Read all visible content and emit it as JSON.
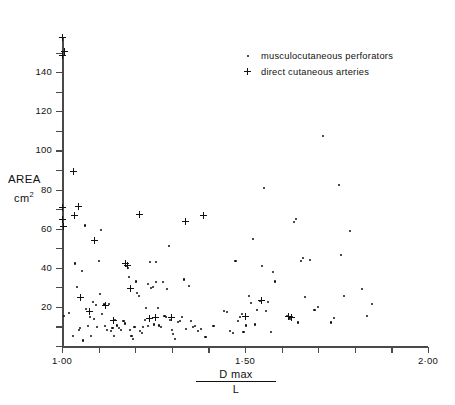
{
  "chart_data": {
    "type": "scatter",
    "title": "",
    "xlabel": "Dmax / L",
    "xlabel_numerator": "D max",
    "xlabel_denominator": "L",
    "ylabel": "AREA",
    "ylabel_unit": "cm2",
    "xlim": [
      1.0,
      2.0
    ],
    "ylim": [
      0,
      160
    ],
    "x_ticks": [
      1.0,
      1.1,
      1.2,
      1.3,
      1.4,
      1.5,
      1.6,
      1.7,
      1.8,
      1.9,
      2.0
    ],
    "x_tick_labels": [
      "1·00",
      "",
      "",
      "",
      "",
      "1·50",
      "",
      "",
      "",
      "",
      "2·00"
    ],
    "y_ticks": [
      0,
      10,
      20,
      30,
      40,
      50,
      60,
      70,
      80,
      90,
      100,
      110,
      120,
      130,
      140,
      150
    ],
    "y_tick_labels": [
      "",
      "",
      "20",
      "",
      "40",
      "",
      "60",
      "",
      "80",
      "",
      "100",
      "",
      "120",
      "",
      "140",
      ""
    ],
    "grid": false,
    "legend_position": "top-right",
    "series": [
      {
        "name": "musculocutaneous perforators",
        "marker": "dot",
        "points": [
          [
            1.006,
            15.3
          ],
          [
            1.018,
            17.0
          ],
          [
            1.03,
            5.0
          ],
          [
            1.036,
            42.2
          ],
          [
            1.04,
            30.3
          ],
          [
            1.046,
            8.0
          ],
          [
            1.05,
            9.0
          ],
          [
            1.054,
            38.5
          ],
          [
            1.058,
            2.8
          ],
          [
            1.062,
            61.6
          ],
          [
            1.066,
            19.0
          ],
          [
            1.072,
            10.0
          ],
          [
            1.076,
            15.0
          ],
          [
            1.08,
            5.0
          ],
          [
            1.084,
            22.5
          ],
          [
            1.088,
            14.0
          ],
          [
            1.092,
            20.8
          ],
          [
            1.096,
            9.5
          ],
          [
            1.1,
            43.3
          ],
          [
            1.104,
            26.5
          ],
          [
            1.106,
            59.5
          ],
          [
            1.11,
            16.5
          ],
          [
            1.114,
            21.2
          ],
          [
            1.118,
            10.3
          ],
          [
            1.122,
            8.0
          ],
          [
            1.128,
            21.3
          ],
          [
            1.134,
            7.8
          ],
          [
            1.138,
            9.0
          ],
          [
            1.142,
            5.3
          ],
          [
            1.146,
            13.2
          ],
          [
            1.15,
            10.5
          ],
          [
            1.156,
            9.0
          ],
          [
            1.162,
            8.2
          ],
          [
            1.168,
            13.0
          ],
          [
            1.172,
            11.5
          ],
          [
            1.176,
            41.0
          ],
          [
            1.18,
            39.8
          ],
          [
            1.184,
            35.5
          ],
          [
            1.186,
            8.0
          ],
          [
            1.19,
            5.0
          ],
          [
            1.194,
            3.5
          ],
          [
            1.198,
            9.5
          ],
          [
            1.202,
            33.0
          ],
          [
            1.206,
            27.0
          ],
          [
            1.21,
            25.5
          ],
          [
            1.214,
            7.5
          ],
          [
            1.218,
            6.5
          ],
          [
            1.222,
            9.5
          ],
          [
            1.226,
            13.5
          ],
          [
            1.23,
            19.5
          ],
          [
            1.234,
            10.0
          ],
          [
            1.236,
            31.5
          ],
          [
            1.24,
            43.0
          ],
          [
            1.244,
            29.5
          ],
          [
            1.248,
            30.0
          ],
          [
            1.252,
            11.0
          ],
          [
            1.256,
            43.0
          ],
          [
            1.258,
            32.8
          ],
          [
            1.262,
            19.5
          ],
          [
            1.266,
            10.5
          ],
          [
            1.27,
            9.5
          ],
          [
            1.276,
            32.5
          ],
          [
            1.28,
            15.5
          ],
          [
            1.284,
            15.0
          ],
          [
            1.288,
            29.0
          ],
          [
            1.292,
            51.0
          ],
          [
            1.296,
            13.5
          ],
          [
            1.3,
            8.0
          ],
          [
            1.304,
            6.0
          ],
          [
            1.308,
            3.5
          ],
          [
            1.316,
            12.5
          ],
          [
            1.322,
            13.0
          ],
          [
            1.328,
            15.0
          ],
          [
            1.334,
            34.0
          ],
          [
            1.34,
            8.5
          ],
          [
            1.346,
            30.5
          ],
          [
            1.352,
            13.0
          ],
          [
            1.358,
            9.5
          ],
          [
            1.364,
            10.0
          ],
          [
            1.372,
            7.5
          ],
          [
            1.38,
            8.5
          ],
          [
            1.392,
            4.5
          ],
          [
            1.414,
            10.0
          ],
          [
            1.442,
            18.0
          ],
          [
            1.452,
            17.5
          ],
          [
            1.46,
            7.5
          ],
          [
            1.468,
            6.5
          ],
          [
            1.474,
            43.3
          ],
          [
            1.48,
            13.0
          ],
          [
            1.486,
            15.0
          ],
          [
            1.492,
            16.5
          ],
          [
            1.496,
            7.0
          ],
          [
            1.502,
            10.5
          ],
          [
            1.51,
            25.5
          ],
          [
            1.516,
            22.0
          ],
          [
            1.522,
            54.5
          ],
          [
            1.528,
            11.0
          ],
          [
            1.534,
            18.5
          ],
          [
            1.54,
            23.0
          ],
          [
            1.546,
            41.0
          ],
          [
            1.552,
            81.0
          ],
          [
            1.558,
            18.0
          ],
          [
            1.564,
            22.5
          ],
          [
            1.57,
            7.0
          ],
          [
            1.576,
            38.0
          ],
          [
            1.582,
            33.0
          ],
          [
            1.614,
            15.5
          ],
          [
            1.62,
            14.5
          ],
          [
            1.624,
            14.0
          ],
          [
            1.628,
            15.0
          ],
          [
            1.634,
            63.5
          ],
          [
            1.64,
            65.0
          ],
          [
            1.646,
            12.0
          ],
          [
            1.652,
            43.5
          ],
          [
            1.658,
            45.0
          ],
          [
            1.664,
            25.0
          ],
          [
            1.678,
            44.0
          ],
          [
            1.69,
            18.5
          ],
          [
            1.7,
            20.0
          ],
          [
            1.712,
            107.5
          ],
          [
            1.736,
            12.0
          ],
          [
            1.742,
            14.5
          ],
          [
            1.756,
            82.5
          ],
          [
            1.762,
            46.5
          ],
          [
            1.77,
            25.5
          ],
          [
            1.788,
            59.0
          ],
          [
            1.82,
            29.0
          ],
          [
            1.834,
            15.5
          ],
          [
            1.846,
            21.5
          ]
        ]
      },
      {
        "name": "direct cutaneous arteries",
        "marker": "plus",
        "points": [
          [
            1.0,
            158.0
          ],
          [
            1.002,
            148.5
          ],
          [
            1.006,
            150.5
          ],
          [
            1.0,
            71.0
          ],
          [
            1.002,
            64.5
          ],
          [
            1.004,
            61.0
          ],
          [
            1.03,
            89.0
          ],
          [
            1.034,
            67.0
          ],
          [
            1.046,
            71.5
          ],
          [
            1.05,
            24.8
          ],
          [
            1.076,
            17.8
          ],
          [
            1.088,
            54.0
          ],
          [
            1.118,
            20.5
          ],
          [
            1.14,
            13.0
          ],
          [
            1.174,
            42.0
          ],
          [
            1.18,
            41.0
          ],
          [
            1.186,
            29.5
          ],
          [
            1.212,
            67.5
          ],
          [
            1.238,
            14.0
          ],
          [
            1.256,
            14.5
          ],
          [
            1.3,
            14.5
          ],
          [
            1.338,
            63.5
          ],
          [
            1.386,
            67.0
          ],
          [
            1.5,
            15.0
          ],
          [
            1.544,
            23.5
          ],
          [
            1.62,
            15.0
          ],
          [
            1.626,
            14.8
          ]
        ]
      }
    ]
  },
  "legend": {
    "items": [
      {
        "marker": "dot",
        "label": "musculocutaneous  perforators"
      },
      {
        "marker": "plus",
        "label": "direct  cutaneous  arteries"
      }
    ]
  },
  "axes": {
    "y_title": "AREA",
    "y_unit_base": "cm",
    "y_unit_sup": "2",
    "x_numerator": "D max",
    "x_denominator": "L"
  },
  "colors": {
    "ink": "#111111",
    "axis": "#4a4a4a",
    "background": "#ffffff"
  }
}
